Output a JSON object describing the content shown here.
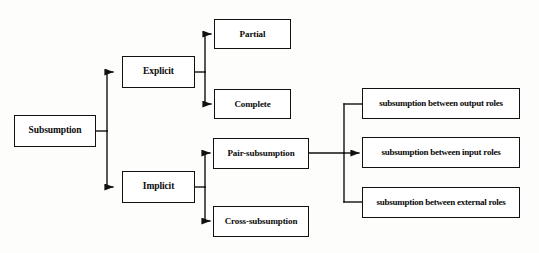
{
  "diagram": {
    "stroke_color": "#111111",
    "fill_color": "#ffffff",
    "background_color": "#fdfdfc",
    "nodes": {
      "subsumption": "Subsumption",
      "explicit": "Explicit",
      "implicit": "Implicit",
      "partial": "Partial",
      "complete": "Complete",
      "pair_subsumption": "Pair-subsumption",
      "cross_subsumption": "Cross-subsumption",
      "output_roles": "subsumption between output roles",
      "input_roles": "subsumption between input roles",
      "external_roles": "subsumption between external roles"
    },
    "edges": [
      {
        "from": "subsumption",
        "to": "explicit",
        "arrow": true
      },
      {
        "from": "subsumption",
        "to": "implicit",
        "arrow": true
      },
      {
        "from": "explicit",
        "to": "partial",
        "arrow": true
      },
      {
        "from": "explicit",
        "to": "complete",
        "arrow": true
      },
      {
        "from": "implicit",
        "to": "pair_subsumption",
        "arrow": true
      },
      {
        "from": "implicit",
        "to": "cross_subsumption",
        "arrow": true
      },
      {
        "from": "pair_subsumption",
        "to": "output_roles",
        "arrow": false
      },
      {
        "from": "pair_subsumption",
        "to": "input_roles",
        "arrow": true
      },
      {
        "from": "pair_subsumption",
        "to": "external_roles",
        "arrow": false
      }
    ]
  }
}
